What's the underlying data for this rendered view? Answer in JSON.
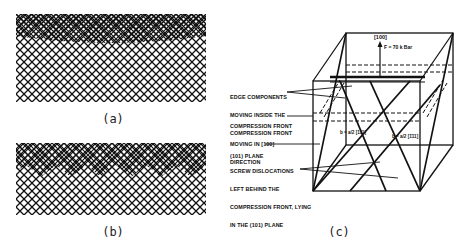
{
  "figure": {
    "panels": [
      {
        "id": "a",
        "caption": "(a)"
      },
      {
        "id": "b",
        "caption": "(b)"
      },
      {
        "id": "c",
        "caption": "(c)"
      }
    ],
    "panel_c": {
      "direction_label": "[100]",
      "force_label": "F = 70 k Bar",
      "burgers_left": "b = a/2 [111]",
      "burgers_right": "b = a/2 [1̄11]",
      "annotations": [
        {
          "id": "edge",
          "lines": [
            "EDGE COMPONENTS",
            "MOVING INSIDE THE",
            "COMPRESSION FRONT"
          ]
        },
        {
          "id": "front",
          "lines": [
            "COMPRESSION FRONT",
            "MOVING IN [100]",
            "DIRECTION"
          ]
        },
        {
          "id": "plane",
          "lines": [
            "(101) PLANE"
          ]
        },
        {
          "id": "screw",
          "lines": [
            "SCREW DISLOCATIONS",
            "LEFT BEHIND THE",
            "COMPRESSION FRONT, LYING",
            "IN THE (101) PLANE"
          ]
        }
      ]
    }
  },
  "colors": {
    "ink": "#111111",
    "background": "#ffffff"
  }
}
